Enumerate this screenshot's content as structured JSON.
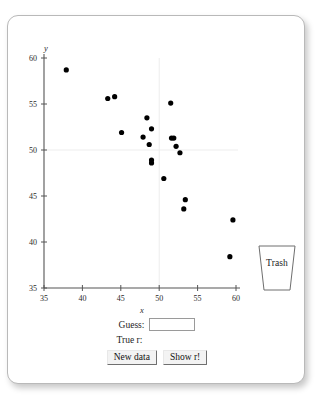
{
  "app": {
    "trash_label": "Trash"
  },
  "controls": {
    "guess_label": "Guess:",
    "guess_value": "",
    "guess_placeholder": "",
    "true_r_label": "True r:",
    "true_r_value": "",
    "new_data_label": "New data",
    "show_r_label": "Show r!"
  },
  "chart_data": {
    "type": "scatter",
    "title": "",
    "xlabel": "x",
    "ylabel": "y",
    "xlim": [
      35,
      60
    ],
    "ylim": [
      35,
      60
    ],
    "xticks": [
      35,
      40,
      45,
      50,
      55,
      60
    ],
    "yticks": [
      35,
      40,
      45,
      50,
      55,
      60
    ],
    "grid": true,
    "gridlines": {
      "x": [
        50
      ],
      "y": [
        50
      ]
    },
    "marker": {
      "shape": "circle",
      "color": "#000000",
      "size": 2.6
    },
    "legend": null,
    "n_points": 22,
    "points": [
      {
        "x": 37.9,
        "y": 58.7
      },
      {
        "x": 43.3,
        "y": 55.6
      },
      {
        "x": 44.2,
        "y": 55.8
      },
      {
        "x": 45.1,
        "y": 51.9
      },
      {
        "x": 48.4,
        "y": 53.5
      },
      {
        "x": 49.0,
        "y": 52.3
      },
      {
        "x": 47.9,
        "y": 51.4
      },
      {
        "x": 48.7,
        "y": 50.6
      },
      {
        "x": 49.0,
        "y": 48.9
      },
      {
        "x": 49.0,
        "y": 48.6
      },
      {
        "x": 51.5,
        "y": 55.1
      },
      {
        "x": 51.6,
        "y": 51.3
      },
      {
        "x": 51.9,
        "y": 51.3
      },
      {
        "x": 52.2,
        "y": 50.4
      },
      {
        "x": 52.7,
        "y": 49.7
      },
      {
        "x": 50.6,
        "y": 46.9
      },
      {
        "x": 53.4,
        "y": 44.6
      },
      {
        "x": 53.2,
        "y": 43.6
      },
      {
        "x": 59.6,
        "y": 42.4
      },
      {
        "x": 59.2,
        "y": 38.4
      }
    ]
  }
}
